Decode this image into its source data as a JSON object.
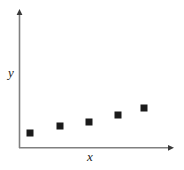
{
  "chart_data": {
    "type": "scatter",
    "title": "",
    "xlabel": "x",
    "ylabel": "y",
    "x": [
      1,
      2,
      3,
      4,
      5
    ],
    "y": [
      15,
      22,
      26,
      33,
      40
    ],
    "series": [
      {
        "name": "data",
        "points": [
          {
            "x": 1,
            "y": 15
          },
          {
            "x": 2,
            "y": 22
          },
          {
            "x": 3,
            "y": 26
          },
          {
            "x": 4,
            "y": 33
          },
          {
            "x": 5,
            "y": 40
          }
        ]
      }
    ],
    "xlim": [
      0,
      6
    ],
    "ylim": [
      0,
      100
    ],
    "grid": false,
    "legend": false,
    "xticks": [],
    "yticks": [],
    "marker": "square",
    "marker_color": "#1a1a1a",
    "marker_size": 7,
    "axis_color": "#808080",
    "axis_arrowheads": true,
    "background": "#ffffff"
  },
  "figure": {
    "width": 184,
    "height": 170,
    "plot": {
      "origin_x": 19,
      "origin_y": 148,
      "x_axis_end": 172,
      "y_axis_top": 11
    },
    "markers_px": [
      {
        "cx": 30,
        "cy": 133
      },
      {
        "cx": 60,
        "cy": 126
      },
      {
        "cx": 89,
        "cy": 122
      },
      {
        "cx": 118,
        "cy": 115
      },
      {
        "cx": 144,
        "cy": 108
      }
    ]
  }
}
